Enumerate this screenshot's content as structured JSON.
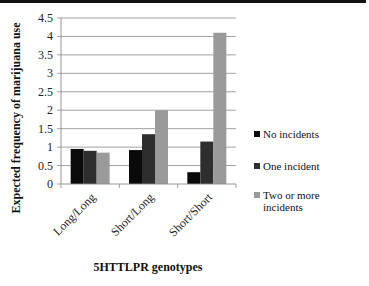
{
  "chart_data": {
    "type": "bar",
    "title": "",
    "xlabel": "5HTTLPR genotypes",
    "ylabel": "Expected frequency of marijuana use",
    "categories": [
      "Long/Long",
      "Short/Long",
      "Short/Short"
    ],
    "ylim": [
      0,
      4.5
    ],
    "yticks": [
      "0",
      "0.5",
      "1",
      "1.5",
      "2",
      "2.5",
      "3",
      "3.5",
      "4",
      "4.5"
    ],
    "grid": true,
    "legend_position": "right",
    "series": [
      {
        "name": "No incidents",
        "color": "#0a0a0a",
        "values": [
          0.95,
          0.92,
          0.32
        ]
      },
      {
        "name": "One incident",
        "color": "#2e2e2e",
        "values": [
          0.9,
          1.35,
          1.15
        ]
      },
      {
        "name": "Two or more incidents",
        "color": "#9a9a9a",
        "values": [
          0.85,
          2.0,
          4.1
        ]
      }
    ]
  },
  "legend": {
    "items": [
      {
        "label": "No incidents"
      },
      {
        "label": "One incident"
      },
      {
        "label": "Two or more incidents"
      }
    ]
  }
}
